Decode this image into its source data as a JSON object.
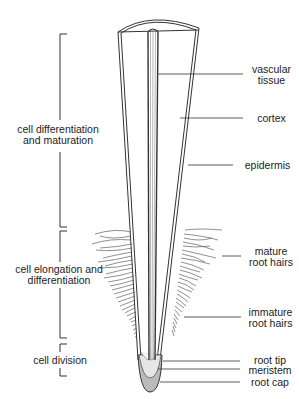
{
  "diagram": {
    "zones": [
      {
        "label_line1": "cell differentiation",
        "label_line2": "and maturation"
      },
      {
        "label_line1": "cell elongation and",
        "label_line2": "differentiation"
      },
      {
        "label_line1": "cell division",
        "label_line2": ""
      }
    ],
    "parts": [
      {
        "label_line1": "vascular",
        "label_line2": "tissue"
      },
      {
        "label_line1": "cortex",
        "label_line2": ""
      },
      {
        "label_line1": "epidermis",
        "label_line2": ""
      },
      {
        "label_line1": "mature",
        "label_line2": "root hairs"
      },
      {
        "label_line1": "immature",
        "label_line2": "root hairs"
      },
      {
        "label_line1": "root tip",
        "label_line2": ""
      },
      {
        "label_line1": "meristem",
        "label_line2": ""
      },
      {
        "label_line1": "root cap",
        "label_line2": ""
      }
    ],
    "colors": {
      "line": "#333333",
      "cap_fill": "#bbbbbb",
      "meristem_fill": "#e6e6e6"
    }
  }
}
